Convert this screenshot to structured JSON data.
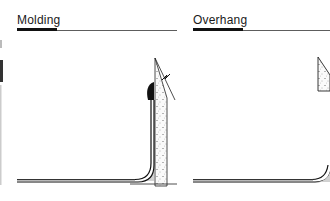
{
  "panels": [
    {
      "title": "Molding",
      "description": "Flooring sheet coved up the wall and finished with a bead of molding at the top edge"
    },
    {
      "title": "Overhang",
      "description": "Flooring sheet coved up the wall and tucked under a wall overhang"
    }
  ],
  "colors": {
    "ink": "#1a1a1a",
    "background": "#ffffff",
    "stipple": "#555555"
  }
}
